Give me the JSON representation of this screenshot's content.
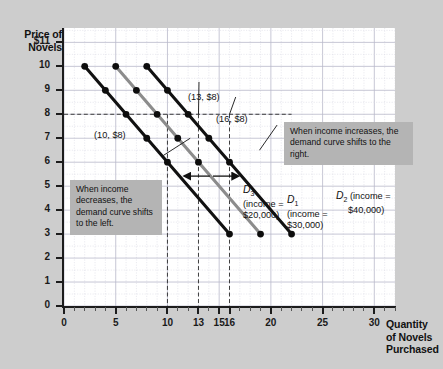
{
  "axes": {
    "y_title_lines": [
      "Price of",
      "Novels"
    ],
    "x_title_lines": [
      "Quantity",
      "of Novels",
      "Purchased"
    ],
    "y_ticks": [
      "$11",
      "10",
      "9",
      "8",
      "7",
      "6",
      "5",
      "4",
      "3",
      "2",
      "1",
      "0"
    ],
    "x_ticks": [
      "0",
      "5",
      "10",
      "13",
      "15",
      "16",
      "20",
      "25",
      "30"
    ]
  },
  "annotations": {
    "point_10_8": "(10, $8)",
    "point_13_8": "(13, $8)",
    "point_16_8": "(16, $8)",
    "callout_left": "When income decreases, the demand curve shifts to the left.",
    "callout_right": "When income increases, the demand curve shifts to the right."
  },
  "legends": {
    "d3_name": "D",
    "d3_sub": "3",
    "d3_income_line1": "(income =",
    "d3_income_line2": "$20,000)",
    "d1_name": "D",
    "d1_sub": "1",
    "d1_income_line1": "(income =",
    "d1_income_line2": "$30,000)",
    "d2_name": "D",
    "d2_sub": "2",
    "d2_income_line1": "(income =",
    "d2_income_line2": "$40,000)"
  },
  "colors": {
    "background": "#cdcdcd",
    "plot_background": "#ffffff",
    "curve_dark": "#111111",
    "curve_gray": "#8c8c8c",
    "callout_background": "#b4b4b4",
    "grid": "#c9c9d6",
    "axis": "#1c1c1c"
  },
  "chart_data": {
    "type": "line",
    "title": "",
    "xlabel": "Quantity of Novels Purchased",
    "ylabel": "Price of Novels",
    "xlim": [
      0,
      32
    ],
    "ylim": [
      0,
      11.6
    ],
    "grid": true,
    "legend_position": "inline-right-of-curves",
    "series": [
      {
        "name": "D3",
        "label": "D3 (income = $20,000)",
        "income": 20000,
        "color": "#111111",
        "x": [
          2,
          4,
          6,
          8,
          10,
          12,
          14,
          16
        ],
        "y": [
          10,
          9,
          8,
          7,
          6,
          5,
          4,
          3
        ],
        "visible_points_x": [
          2,
          4,
          6,
          8,
          10
        ],
        "visible_points_y": [
          10,
          9,
          8,
          7,
          6
        ]
      },
      {
        "name": "D1",
        "label": "D1 (income = $30,000)",
        "income": 30000,
        "color": "#8c8c8c",
        "x": [
          5,
          7,
          9,
          11,
          13,
          15,
          17,
          19
        ],
        "y": [
          10,
          9,
          8,
          7,
          6,
          5,
          4,
          3
        ],
        "visible_points_x": [
          5,
          7,
          9,
          11,
          13
        ],
        "visible_points_y": [
          10,
          9,
          8,
          7,
          6
        ]
      },
      {
        "name": "D2",
        "label": "D2 (income = $40,000)",
        "income": 40000,
        "color": "#111111",
        "x": [
          8,
          10,
          12,
          14,
          16,
          18,
          20,
          22
        ],
        "y": [
          10,
          9,
          8,
          7,
          6,
          5,
          4,
          3
        ],
        "visible_points_x": [
          8,
          10,
          12,
          14,
          16
        ],
        "visible_points_y": [
          10,
          9,
          8,
          7,
          6
        ]
      }
    ],
    "reference_lines": {
      "horizontal": [
        {
          "y": 8,
          "style": "dashed"
        }
      ],
      "vertical": [
        {
          "x": 10,
          "style": "dashed"
        },
        {
          "x": 13,
          "style": "dashed"
        },
        {
          "x": 16,
          "style": "dashed"
        }
      ]
    },
    "marked_points": [
      {
        "x": 10,
        "y": 8,
        "label": "(10, $8)",
        "curve": "D3"
      },
      {
        "x": 13,
        "y": 8,
        "label": "(13, $8)",
        "curve": "D1"
      },
      {
        "x": 16,
        "y": 8,
        "label": "(16, $8)",
        "curve": "D2"
      }
    ],
    "shift_arrows": [
      {
        "direction": "left",
        "meaning": "income decreases"
      },
      {
        "direction": "right",
        "meaning": "income increases"
      }
    ]
  }
}
